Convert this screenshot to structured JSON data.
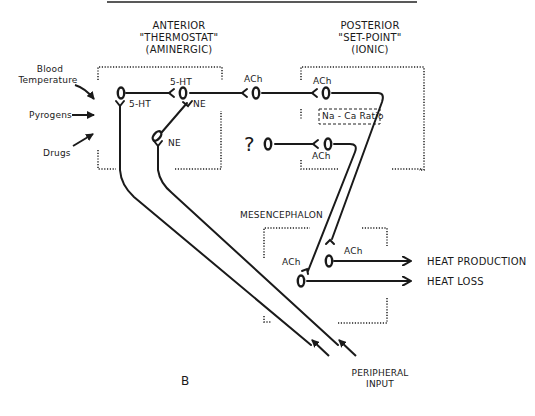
{
  "figure": {
    "panel_label": "B",
    "regions": {
      "anterior": {
        "line1": "ANTERIOR",
        "line2": "\"THERMOSTAT\"",
        "line3": "(AMINERGIC)"
      },
      "posterior": {
        "line1": "POSTERIOR",
        "line2": "\"SET-POINT\"",
        "line3": "(IONIC)"
      },
      "mesencephalon": "MESENCEPHALON"
    },
    "inputs": {
      "blood_temperature_1": "Blood",
      "blood_temperature_2": "Temperature",
      "pyrogens": "Pyrogens",
      "drugs": "Drugs",
      "peripheral_1": "PERIPHERAL",
      "peripheral_2": "INPUT"
    },
    "synapses": {
      "ant_5ht_left": "5-HT",
      "ant_5ht_top": "5-HT",
      "ant_ne_right": "NE",
      "ant_ne_lower": "NE",
      "ach_mid": "ACh",
      "post_ach_top": "ACh",
      "post_ach_lower": "ACh",
      "unknown": "?",
      "mes_ach_left": "ACh",
      "mes_ach_right": "ACh"
    },
    "na_ca_box": "Na - Ca Ratio",
    "outputs": {
      "heat_production": "HEAT PRODUCTION",
      "heat_loss": "HEAT LOSS"
    }
  }
}
